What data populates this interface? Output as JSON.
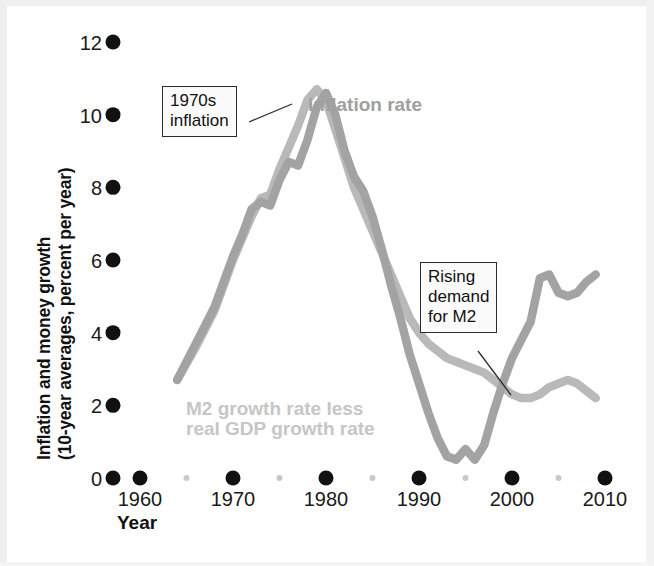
{
  "chart_data": {
    "type": "line",
    "title": "",
    "xlabel": "Year",
    "ylabel": "Inflation and money growth (10-year averages, percent per year)",
    "ylabel_line1": "Inflation and money growth",
    "ylabel_line2": "(10-year averages, percent per year)",
    "xlim": [
      1955,
      2012
    ],
    "ylim": [
      0,
      12
    ],
    "yticks": [
      0,
      2,
      4,
      6,
      8,
      10,
      12
    ],
    "ytick_labels": [
      "0",
      "2",
      "4",
      "6",
      "8",
      "10",
      "12"
    ],
    "xticks": [
      1960,
      1970,
      1980,
      1990,
      2000,
      2010
    ],
    "xtick_labels": [
      "1960",
      "1970",
      "1980",
      "1990",
      "2000",
      "2010"
    ],
    "x_minor_ticks": [
      1965,
      1975,
      1985,
      1995,
      2005
    ],
    "grid": false,
    "legend_position": "inline-labels",
    "series": [
      {
        "name": "Inflation rate",
        "color": "#b9b9b9",
        "label_x": 1991,
        "label_y": 10.0,
        "x": [
          1964,
          1966,
          1968,
          1970,
          1971,
          1972,
          1973,
          1974,
          1975,
          1976,
          1977,
          1978,
          1979,
          1980,
          1981,
          1982,
          1983,
          1984,
          1985,
          1986,
          1987,
          1988,
          1989,
          1990,
          1991,
          1992,
          1993,
          1994,
          1995,
          1996,
          1997,
          1998,
          1999,
          2000,
          2001,
          2002,
          2003,
          2004,
          2005,
          2006,
          2007,
          2008,
          2009
        ],
        "y": [
          2.7,
          3.6,
          4.6,
          6.0,
          6.6,
          7.2,
          7.7,
          7.8,
          8.5,
          9.1,
          9.7,
          10.4,
          10.7,
          10.4,
          9.6,
          8.8,
          8.0,
          7.4,
          6.8,
          6.2,
          5.6,
          5.0,
          4.4,
          4.0,
          3.7,
          3.5,
          3.3,
          3.2,
          3.1,
          3.0,
          2.9,
          2.7,
          2.5,
          2.3,
          2.2,
          2.2,
          2.3,
          2.5,
          2.6,
          2.7,
          2.6,
          2.4,
          2.2
        ]
      },
      {
        "name": "M2 growth rate less real GDP growth rate",
        "color": "#a3a3a3",
        "label_x": 1976,
        "label_y": 1.6,
        "label_line1": "M2 growth rate less",
        "label_line2": "real GDP growth rate",
        "x": [
          1964,
          1966,
          1968,
          1970,
          1971,
          1972,
          1973,
          1974,
          1975,
          1976,
          1977,
          1978,
          1979,
          1980,
          1981,
          1982,
          1983,
          1984,
          1985,
          1986,
          1987,
          1988,
          1989,
          1990,
          1991,
          1992,
          1993,
          1994,
          1995,
          1996,
          1997,
          1998,
          1999,
          2000,
          2001,
          2002,
          2003,
          2004,
          2005,
          2006,
          2007,
          2008,
          2009
        ],
        "y": [
          2.7,
          3.7,
          4.7,
          6.1,
          6.7,
          7.4,
          7.6,
          7.5,
          8.2,
          8.7,
          8.6,
          9.3,
          10.2,
          10.6,
          10.0,
          9.0,
          8.3,
          7.9,
          7.2,
          6.3,
          5.3,
          4.4,
          3.4,
          2.6,
          1.8,
          1.1,
          0.6,
          0.5,
          0.8,
          0.5,
          0.9,
          1.8,
          2.6,
          3.3,
          3.8,
          4.3,
          5.5,
          5.6,
          5.1,
          5.0,
          5.1,
          5.4,
          5.6
        ]
      }
    ],
    "annotations": [
      {
        "id": "1970s-inflation",
        "text": "1970s\ninflation",
        "line1": "1970s",
        "line2": "inflation",
        "box_x": 162,
        "box_y": 86,
        "leader_from": [
          249,
          122
        ],
        "leader_to": [
          292,
          104
        ]
      },
      {
        "id": "rising-demand-for-m2",
        "text": "Rising\ndemand\nfor M2",
        "line1": "Rising",
        "line2": "demand",
        "line3": "for M2",
        "box_x": 420,
        "box_y": 262,
        "leader_from": [
          478,
          351
        ],
        "leader_to": [
          511,
          395
        ]
      }
    ]
  },
  "axis": {
    "y_label_line1": "Inflation and money growth",
    "y_label_line2": "(10-year averages, percent per year)",
    "x_title": "Year",
    "ytick_labels": [
      "12",
      "10",
      "8",
      "6",
      "4",
      "2",
      "0"
    ],
    "xtick_labels": [
      "1960",
      "1970",
      "1980",
      "1990",
      "2000",
      "2010"
    ]
  },
  "labels": {
    "inflation_rate": "Inflation rate",
    "m2_line1": "M2 growth rate less",
    "m2_line2": "real GDP growth rate"
  },
  "callouts": {
    "c1_line1": "1970s",
    "c1_line2": "inflation",
    "c2_line1": "Rising",
    "c2_line2": "demand",
    "c2_line3": "for M2"
  },
  "colors": {
    "inflation_line": "#b9b9b9",
    "m2_line": "#a3a3a3",
    "tick_dot": "#111111",
    "minor_tick_dot": "#c9c9c9",
    "text": "#111111",
    "background": "#ffffff"
  }
}
